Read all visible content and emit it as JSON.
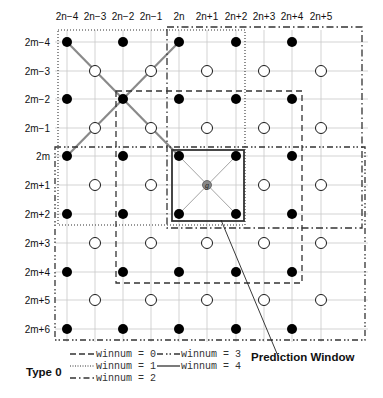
{
  "diagram": {
    "type_label": "Type 0",
    "annotation": "Prediction Window",
    "center_label": "g",
    "column_labels": [
      "2n−4",
      "2n−3",
      "2n−2",
      "2n−1",
      "2n",
      "2n+1",
      "2n+2",
      "2n+3",
      "2n+4",
      "2n+5"
    ],
    "row_labels": [
      "2m−4",
      "2m−3",
      "2m−2",
      "2m−1",
      "2m",
      "2m+1",
      "2m+2",
      "2m+3",
      "2m+4",
      "2m+5",
      "2m+6"
    ],
    "legend": [
      {
        "label": "winnum = 0",
        "style": "dashed"
      },
      {
        "label": "winnum = 1",
        "style": "dotted"
      },
      {
        "label": "winnum = 2",
        "style": "dash-dot"
      },
      {
        "label": "winnum = 3",
        "style": "dash-dot-dot"
      },
      {
        "label": "winnum = 4",
        "style": "solid"
      }
    ],
    "node_legend": {
      "filled": "even column & even row",
      "hollow": "odd column & odd row"
    },
    "colors": {
      "grid": "#c8c8c8",
      "line": "#333333",
      "diag": "#8a8a8a",
      "node": "#000000"
    }
  }
}
